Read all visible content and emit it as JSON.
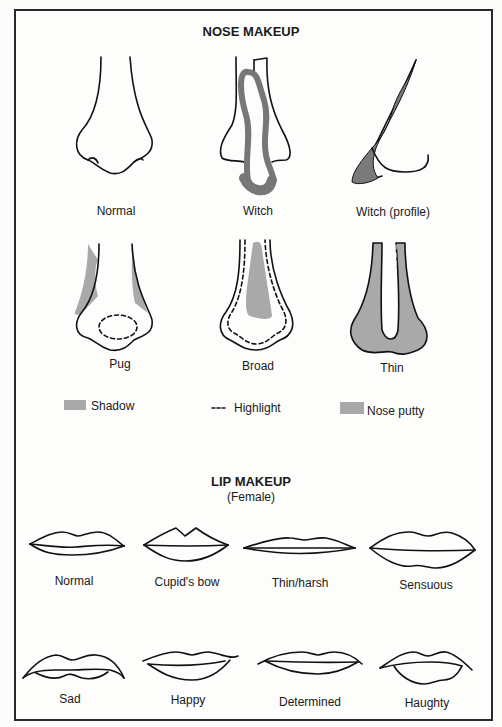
{
  "nose_section": {
    "title": "NOSE MAKEUP",
    "items": [
      {
        "label": "Normal"
      },
      {
        "label": "Witch"
      },
      {
        "label": "Witch (profile)"
      },
      {
        "label": "Pug"
      },
      {
        "label": "Broad"
      },
      {
        "label": "Thin"
      }
    ],
    "legend": [
      {
        "label": "Shadow",
        "symbol": "gray-swatch"
      },
      {
        "label": "Highlight",
        "symbol": "dashed-line"
      },
      {
        "label": "Nose putty",
        "symbol": "light-gray-swatch"
      }
    ]
  },
  "lip_section": {
    "title": "LIP MAKEUP",
    "subtitle": "(Female)",
    "items": [
      {
        "label": "Normal"
      },
      {
        "label": "Cupid's bow"
      },
      {
        "label": "Thin/harsh"
      },
      {
        "label": "Sensuous"
      },
      {
        "label": "Sad"
      },
      {
        "label": "Happy"
      },
      {
        "label": "Determined"
      },
      {
        "label": "Haughty"
      }
    ]
  },
  "colors": {
    "shadow": "#a9a9a9",
    "witch_shadow": "#7a7a7a",
    "line": "#111111"
  }
}
